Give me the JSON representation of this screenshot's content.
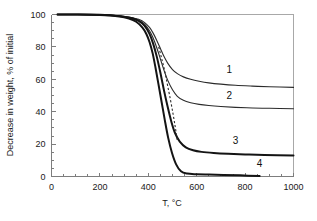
{
  "chart_data": {
    "type": "line",
    "title": "",
    "subtitle": "",
    "xlabel": "T, °C",
    "ylabel": "Decrease in weight, % of initial",
    "xlim": [
      0,
      1000
    ],
    "ylim": [
      0,
      100
    ],
    "xticks": [
      0,
      200,
      400,
      600,
      800,
      1000
    ],
    "yticks": [
      0,
      20,
      40,
      60,
      80,
      100
    ],
    "xtick_labels": [
      "0",
      "200",
      "400",
      "600",
      "800",
      "1000"
    ],
    "ytick_labels": [
      "0",
      "20",
      "40",
      "60",
      "80",
      "100"
    ],
    "grid": false,
    "legend": "inline-curve-numbers",
    "annotations": [
      {
        "text": "1",
        "x": 735,
        "y": 66
      },
      {
        "text": "2",
        "x": 735,
        "y": 50
      },
      {
        "text": "3",
        "x": 760,
        "y": 22
      },
      {
        "text": "4",
        "x": 860,
        "y": 8
      }
    ],
    "series": [
      {
        "name": "1",
        "style": "solid-thin",
        "x": [
          25,
          100,
          200,
          280,
          330,
          360,
          385,
          405,
          420,
          435,
          450,
          465,
          480,
          500,
          520,
          545,
          575,
          610,
          650,
          700,
          760,
          830,
          900,
          1000
        ],
        "values": [
          100,
          100,
          99.8,
          99.2,
          98.2,
          97.0,
          95.0,
          92.0,
          88.5,
          84.0,
          79.0,
          74.0,
          70.0,
          66.0,
          63.5,
          61.5,
          60.0,
          58.8,
          57.8,
          57.0,
          56.3,
          55.8,
          55.4,
          55.0
        ]
      },
      {
        "name": "2",
        "style": "solid-thin",
        "x": [
          25,
          100,
          200,
          280,
          330,
          360,
          385,
          405,
          420,
          435,
          450,
          465,
          480,
          500,
          520,
          545,
          575,
          610,
          650,
          700,
          760,
          830,
          900,
          1000
        ],
        "values": [
          100,
          100,
          99.8,
          99.2,
          98.0,
          96.5,
          94.0,
          90.0,
          85.5,
          79.5,
          72.5,
          65.5,
          59.5,
          53.5,
          49.5,
          47.0,
          45.5,
          44.5,
          43.8,
          43.2,
          42.7,
          42.3,
          42.1,
          41.8
        ]
      },
      {
        "name": "3",
        "style": "solid-thick",
        "x": [
          25,
          100,
          200,
          280,
          330,
          360,
          385,
          405,
          420,
          435,
          450,
          465,
          480,
          495,
          510,
          530,
          555,
          585,
          620,
          670,
          730,
          800,
          880,
          1000
        ],
        "values": [
          100,
          100,
          99.8,
          99.0,
          97.8,
          96.0,
          93.0,
          88.0,
          82.0,
          74.0,
          64.0,
          53.0,
          43.0,
          34.0,
          27.0,
          21.5,
          18.0,
          16.2,
          15.2,
          14.5,
          14.0,
          13.6,
          13.3,
          13.0
        ]
      },
      {
        "name": "4",
        "style": "solid-thick",
        "x": [
          25,
          100,
          200,
          280,
          320,
          350,
          375,
          392,
          405,
          418,
          430,
          442,
          455,
          468,
          482,
          498,
          515,
          535,
          560,
          600,
          650,
          710,
          780,
          860
        ],
        "values": [
          100,
          100,
          99.7,
          98.8,
          97.5,
          95.5,
          92.0,
          88.0,
          83.0,
          76.0,
          67.0,
          57.0,
          46.0,
          35.0,
          24.0,
          14.5,
          7.5,
          3.2,
          1.8,
          1.4,
          1.2,
          1.0,
          0.7,
          0.3
        ]
      },
      {
        "name": "dashed-trace",
        "style": "dashed",
        "x": [
          443,
          455,
          468,
          480,
          492,
          503,
          512,
          520
        ],
        "values": [
          80.0,
          73.0,
          65.0,
          56.0,
          47.0,
          38.0,
          30.0,
          22.0
        ]
      }
    ]
  }
}
